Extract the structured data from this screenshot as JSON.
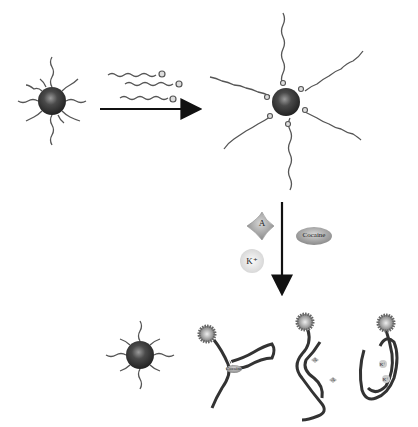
{
  "figure": {
    "step1": {
      "label": "nanoparticle with short DNA strands"
    },
    "step2": {
      "label": "nanoparticle hybridized with dye-labeled long strands"
    },
    "targets": {
      "adenosine_label": "A",
      "cocaine_label": "Cocaine",
      "potassium_label": "K⁺"
    },
    "products": {
      "cocaine_aptamer_label": "Cocaine",
      "adenosine_aptamer_labels": [
        "A",
        "A"
      ],
      "potassium_quadruplex_labels": [
        "K⁺",
        "K⁺"
      ]
    },
    "colors": {
      "particle": "#3a3a3a",
      "strand": "#555555",
      "arrow": "#111111",
      "background": "#ffffff"
    }
  }
}
